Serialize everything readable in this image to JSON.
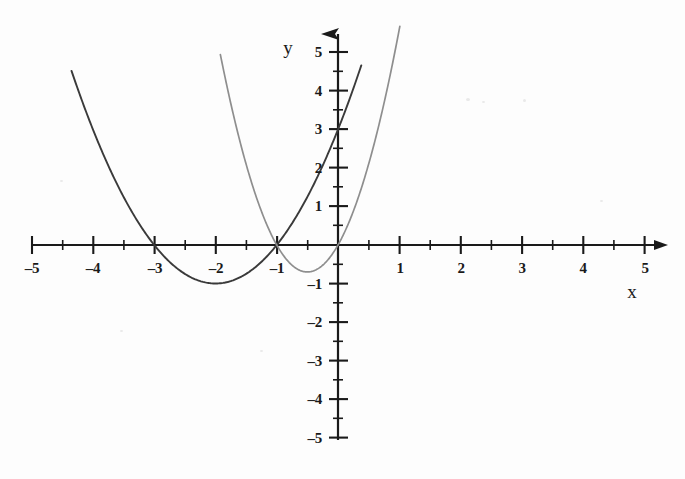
{
  "figure": {
    "background_color": "#fdfdfd",
    "ink_color": "#1a1a1a",
    "curve_dark_color": "#3a3a3a",
    "curve_light_color": "#8e8e8e"
  },
  "axes": {
    "x_name": "x",
    "y_name": "y",
    "x_ticks": [
      {
        "value": -5,
        "label": "–5"
      },
      {
        "value": -4,
        "label": "–4"
      },
      {
        "value": -3,
        "label": "–3"
      },
      {
        "value": -2,
        "label": "–2"
      },
      {
        "value": -1,
        "label": "–1"
      },
      {
        "value": 1,
        "label": "1"
      },
      {
        "value": 2,
        "label": "2"
      },
      {
        "value": 3,
        "label": "3"
      },
      {
        "value": 4,
        "label": "4"
      },
      {
        "value": 5,
        "label": "5"
      }
    ],
    "y_ticks": [
      {
        "value": 5,
        "label": "5"
      },
      {
        "value": 4,
        "label": "4"
      },
      {
        "value": 3,
        "label": "3"
      },
      {
        "value": 2,
        "label": "2"
      },
      {
        "value": 1,
        "label": "1"
      },
      {
        "value": -1,
        "label": "–1"
      },
      {
        "value": -2,
        "label": "–2"
      },
      {
        "value": -3,
        "label": "–3"
      },
      {
        "value": -4,
        "label": "–4"
      },
      {
        "value": -5,
        "label": "–5"
      }
    ],
    "x_minor_step": 0.5,
    "y_minor_step": 0.5,
    "x_arrow": true,
    "y_arrow": true
  },
  "chart_data": {
    "type": "line",
    "title": "",
    "subtitle": "",
    "xlabel": "x",
    "ylabel": "y",
    "xlim": [
      -5,
      5
    ],
    "ylim": [
      -5,
      5
    ],
    "grid": false,
    "legend": "none",
    "x_ticks": [
      -5,
      -4,
      -3,
      -2,
      -1,
      0,
      1,
      2,
      3,
      4,
      5
    ],
    "y_ticks": [
      -5,
      -4,
      -3,
      -2,
      -1,
      0,
      1,
      2,
      3,
      4,
      5
    ],
    "x_minor_ticks": [
      -4.5,
      -3.5,
      -2.5,
      -1.5,
      -0.5,
      0.5,
      1.5,
      2.5,
      3.5,
      4.5
    ],
    "y_minor_ticks": [
      -4.5,
      -3.5,
      -2.5,
      -1.5,
      -0.5,
      0.5,
      1.5,
      2.5,
      3.5,
      4.5
    ],
    "series": [
      {
        "name": "parabola-dark",
        "equation": "y = (x + 2)^2 - 1",
        "color": "#3a3a3a",
        "vertex": [
          -2,
          -1
        ],
        "roots": [
          -3,
          -1
        ],
        "y_intercept": 3,
        "x_domain": [
          -4.35,
          0.38
        ],
        "x": [
          -4.35,
          -4.0,
          -3.5,
          -3.0,
          -2.5,
          -2.0,
          -1.5,
          -1.0,
          -0.5,
          0.0,
          0.38
        ],
        "values": [
          4.52,
          3.0,
          1.25,
          0.0,
          -0.75,
          -1.0,
          -0.75,
          0.0,
          1.25,
          3.0,
          4.67
        ]
      },
      {
        "name": "parabola-light",
        "equation": "y = 2.8(x + 0.5)^2 - 0.7",
        "color": "#8e8e8e",
        "vertex": [
          -0.5,
          -0.7
        ],
        "roots": [
          -1.0,
          0.0
        ],
        "y_intercept": 0,
        "x_domain": [
          -1.92,
          1.48
        ],
        "x": [
          -1.92,
          -1.75,
          -1.5,
          -1.25,
          -1.0,
          -0.75,
          -0.5,
          -0.25,
          0.0,
          0.25,
          0.5,
          0.75,
          1.0,
          1.25,
          1.48
        ],
        "values": [
          4.74,
          3.8,
          2.1,
          0.98,
          0.0,
          -0.53,
          -0.7,
          -0.53,
          0.0,
          0.98,
          2.1,
          3.0,
          5.6,
          7.0,
          8.0
        ]
      }
    ],
    "annotations": [
      {
        "text": "y",
        "position": [
          -0.82,
          5.12
        ],
        "role": "y-axis-name"
      },
      {
        "text": "x",
        "position": [
          4.8,
          -1.2
        ],
        "role": "x-axis-name"
      }
    ]
  }
}
